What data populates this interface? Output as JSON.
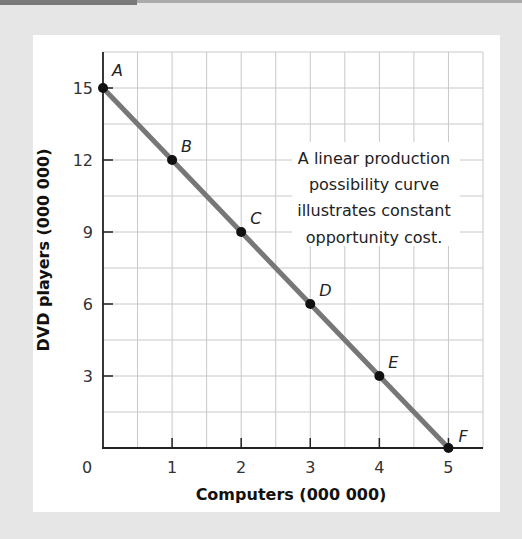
{
  "chart_data": {
    "type": "line",
    "title": "",
    "xlabel": "Computers (000 000)",
    "ylabel": "DVD players (000 000)",
    "xlim": [
      0,
      5.5
    ],
    "ylim": [
      0,
      16.5
    ],
    "x_ticks": [
      0,
      1,
      2,
      3,
      4,
      5
    ],
    "x_tick_labels": [
      "0",
      "1",
      "2",
      "3",
      "4",
      "5"
    ],
    "y_ticks": [
      3,
      6,
      9,
      12,
      15
    ],
    "y_tick_labels": [
      "3",
      "6",
      "9",
      "12",
      "15"
    ],
    "grid": true,
    "grid_step_x": 0.5,
    "grid_step_y": 1.5,
    "series": [
      {
        "name": "Production possibility curve",
        "points": [
          {
            "label": "A",
            "x": 0,
            "y": 15
          },
          {
            "label": "B",
            "x": 1,
            "y": 12
          },
          {
            "label": "C",
            "x": 2,
            "y": 9
          },
          {
            "label": "D",
            "x": 3,
            "y": 6
          },
          {
            "label": "E",
            "x": 4,
            "y": 3
          },
          {
            "label": "F",
            "x": 5,
            "y": 0
          }
        ]
      }
    ],
    "annotation": {
      "lines": [
        "A linear production",
        "possibility curve",
        "illustrates constant",
        "opportunity cost."
      ]
    },
    "colors": {
      "line": "#777777",
      "points": "#111111",
      "grid": "#c8c8c8",
      "axis": "#222222"
    }
  }
}
